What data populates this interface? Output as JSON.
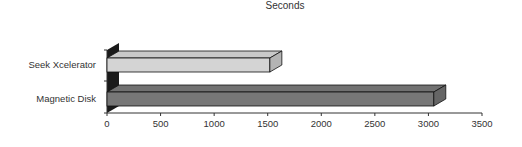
{
  "chart_data": {
    "type": "bar",
    "orientation": "horizontal",
    "style": "3d",
    "title": "Seconds",
    "xlabel": "",
    "ylabel": "",
    "categories": [
      "Seek Xcelerator",
      "Magnetic Disk"
    ],
    "values": [
      1520,
      3050
    ],
    "colors": [
      "#d4d4d4",
      "#777777"
    ],
    "xlim": [
      0,
      3500
    ],
    "xticks": [
      "0",
      "500",
      "1000",
      "1500",
      "2000",
      "2500",
      "3000",
      "3500"
    ],
    "grid": false,
    "legend": null
  }
}
